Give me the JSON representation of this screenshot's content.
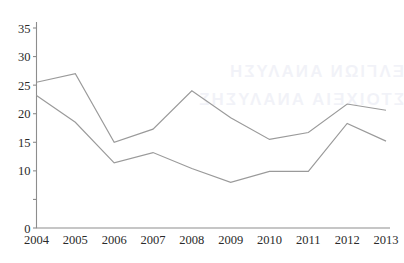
{
  "chart_data": {
    "type": "line",
    "title": "",
    "subtitle": "",
    "xlabel": "",
    "ylabel": "",
    "categories": [
      "2004",
      "2005",
      "2006",
      "2007",
      "2008",
      "2009",
      "2010",
      "2011",
      "2012",
      "2013"
    ],
    "x": [
      2004,
      2005,
      2006,
      2007,
      2008,
      2009,
      2010,
      2011,
      2012,
      2013
    ],
    "series": [
      {
        "name": "upper-series",
        "color": "#9a9a9a",
        "values": [
          25.5,
          27.0,
          15.0,
          17.3,
          24.0,
          19.3,
          15.5,
          16.7,
          21.7,
          20.6
        ]
      },
      {
        "name": "lower-series",
        "color": "#9a9a9a",
        "values": [
          23.2,
          18.5,
          11.4,
          13.2,
          10.4,
          8.0,
          9.9,
          9.9,
          18.3,
          15.2
        ]
      }
    ],
    "ylim": [
      0,
      36.5
    ],
    "xlim": [
      2004,
      2013
    ],
    "ytick_labels": [
      "0",
      "10",
      "15",
      "20",
      "25",
      "30",
      "35"
    ],
    "ytick_values": [
      0,
      10,
      15,
      20,
      25,
      30,
      35
    ],
    "ytick_marks": [
      0,
      5,
      10,
      15,
      20,
      25,
      30,
      35
    ],
    "grid": false,
    "legend": null,
    "legend_position": "none",
    "annotations": []
  },
  "watermark": {
    "line1": "ΕΛΓΙΩΝ ΑΝΑΛΥΣΗ",
    "line2": "ΣΤΟΙΧΕΙΑ ΑΝΑΛΥΣΗΣ"
  }
}
